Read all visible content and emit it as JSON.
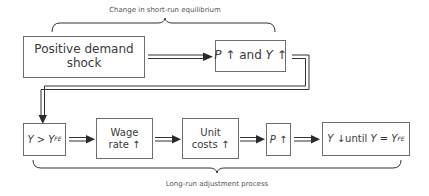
{
  "top_brace": {
    "label": "Change in short-run equilibrium"
  },
  "bottom_brace": {
    "label": "Long-run adjustment process"
  },
  "top_row": {
    "shock": {
      "text": "Positive demand shock"
    },
    "result": {
      "p": "P",
      "and": "and",
      "y": "Y",
      "arrow": "↑"
    }
  },
  "bottom_row": {
    "output_gap": {
      "y": "Y",
      "op": ">",
      "yfe": "Y",
      "sub": "FE"
    },
    "wage": {
      "line1": "Wage",
      "line2": "rate",
      "arrow": "↑"
    },
    "costs": {
      "line1": "Unit",
      "line2": "costs",
      "arrow": "↑"
    },
    "price": {
      "p": "P",
      "arrow": "↑"
    },
    "adjust": {
      "y": "Y",
      "arrow": "↓",
      "until": "until",
      "y2": "Y",
      "eq": "=",
      "y3": "Y",
      "sub": "FE"
    }
  },
  "colors": {
    "line": "#3a3a3a",
    "box_border": "#6e6e6e",
    "text": "#3a3a3a"
  }
}
